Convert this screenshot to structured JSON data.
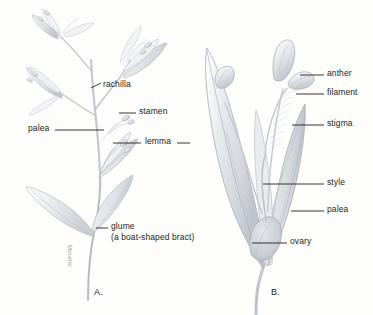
{
  "figure": {
    "background_color": "#fdfdfc",
    "ink_color": "#231f20",
    "pencil_color": "#b9bcc0"
  },
  "panels": [
    {
      "id": "A",
      "letter": "A.",
      "caption": "Spikelet with glumes, lemmas, paleas and rachilla"
    },
    {
      "id": "B",
      "letter": "B.",
      "caption": "Single floret opened to show stamens and pistil"
    }
  ],
  "labels": {
    "rachilla": "rachilla",
    "stamen": "stamen",
    "palea_a": "palea",
    "lemma": "lemma",
    "glume": "glume",
    "glume_note": "(a boat-shaped bract)",
    "anther": "anther",
    "filament": "filament",
    "stigma": "stigma",
    "style": "style",
    "palea_b": "palea",
    "ovary": "ovary"
  },
  "signature": {
    "artist": "Morello"
  }
}
